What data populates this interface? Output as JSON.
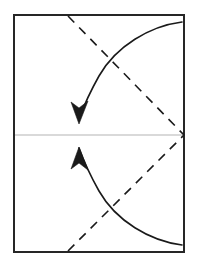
{
  "figure": {
    "canvas": {
      "width": 199,
      "height": 264,
      "background": "#ffffff"
    }
  },
  "colors": {
    "paper_border": "#262626",
    "center_crease": "#b4b4b4",
    "fold_line": "#1a1a1a",
    "arrow": "#1a1a1a",
    "paper_fill": "#ffffff"
  },
  "paper_sheet": {
    "label": "paper sheet",
    "x": 14,
    "y": 15,
    "width": 170,
    "height": 237,
    "stroke_width": 2
  },
  "center_crease": {
    "label": "horizontal center crease",
    "x1": 15,
    "y1": 135,
    "x2": 184,
    "y2": 135,
    "stroke_width": 1.2
  },
  "fold_lines": [
    {
      "name": "upper-fold-line",
      "label": "upper dashed fold line",
      "x1": 68,
      "y1": 16,
      "x2": 184,
      "y2": 135,
      "dash": "9 7",
      "stroke_width": 1.6
    },
    {
      "name": "lower-fold-line",
      "label": "lower dashed fold line",
      "x1": 68,
      "y1": 251,
      "x2": 184,
      "y2": 135,
      "dash": "9 7",
      "stroke_width": 1.6
    }
  ],
  "fold_arrows": [
    {
      "name": "upper-fold-arrow",
      "label": "upper curved fold arrow pointing down",
      "direction": "down",
      "path": "M 182 22 C 150 26 116 46 99 76 C 90 92 83 108 79 119",
      "head": "M 79 124 L 71 102 L 79 108 L 88 101 Z",
      "stroke_width": 1.6
    },
    {
      "name": "lower-fold-arrow",
      "label": "lower curved fold arrow pointing up",
      "direction": "up",
      "path": "M 182 245 C 150 241 116 221 99 191 C 90 175 83 159 79 148",
      "head": "M 79 147 L 71 169 L 79 163 L 88 170 Z",
      "stroke_width": 1.6
    }
  ]
}
